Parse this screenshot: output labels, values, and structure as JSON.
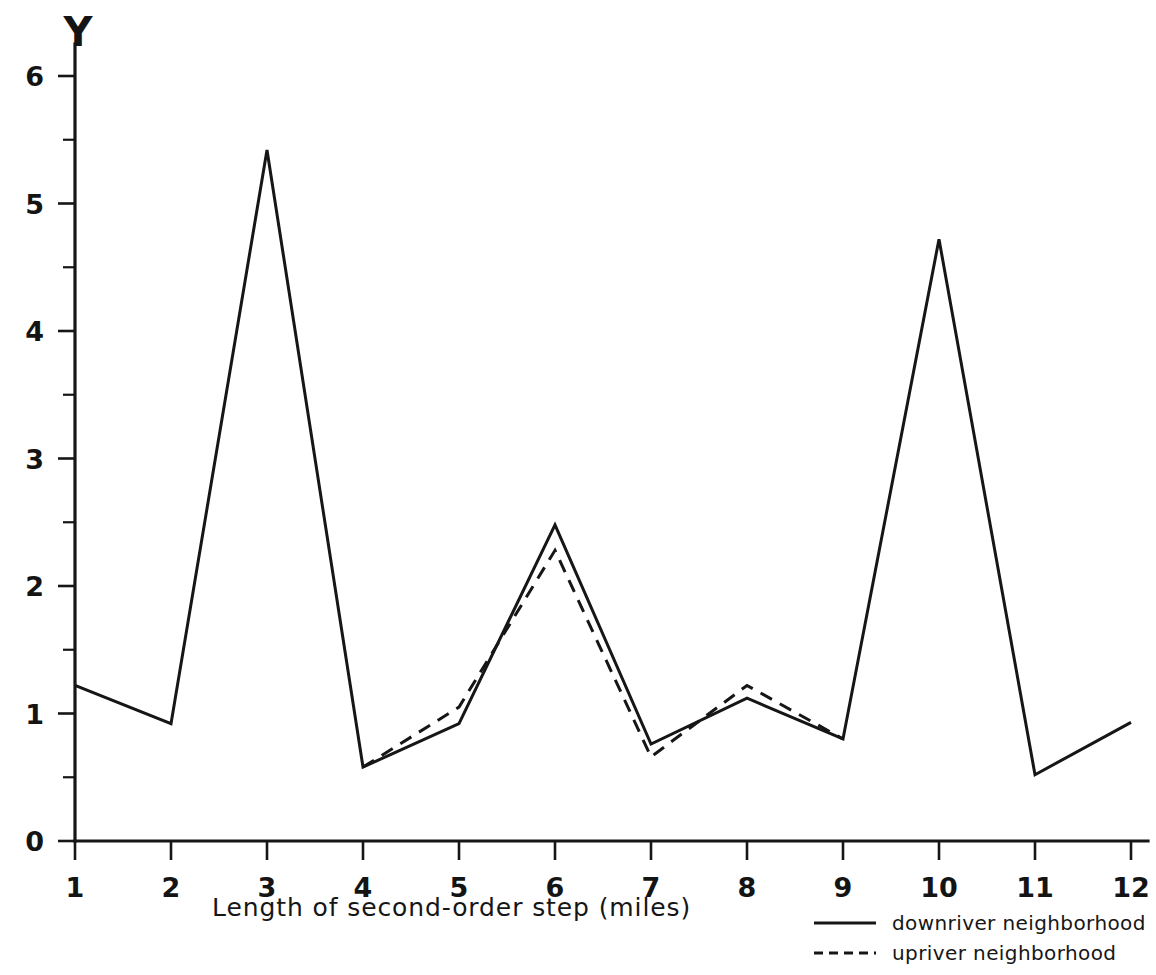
{
  "chart_data": {
    "type": "line",
    "title": "",
    "xlabel": "Length of second-order step (miles)",
    "ylabel": "Y",
    "x": [
      1,
      2,
      3,
      4,
      5,
      6,
      7,
      8,
      9,
      10,
      11,
      12
    ],
    "xticklabels": [
      "1",
      "2",
      "3",
      "4",
      "5",
      "6",
      "7",
      "8",
      "9",
      "10",
      "11",
      "12"
    ],
    "yticklabels": [
      "0",
      "1",
      "2",
      "3",
      "4",
      "5",
      "6"
    ],
    "ytickvalues": [
      0,
      1,
      2,
      3,
      4,
      5,
      6
    ],
    "yminorticks": [
      0.5,
      1.5,
      2.5,
      3.5,
      4.5,
      5.5
    ],
    "xlim": [
      0.7,
      12.35
    ],
    "ylim": [
      0,
      6.25
    ],
    "grid": false,
    "legend_position": "bottom-right",
    "series": [
      {
        "name": "downriver neighborhood",
        "style": "solid",
        "color": "#161616",
        "x": [
          1,
          2,
          3,
          4,
          5,
          6,
          7,
          8,
          9,
          10,
          11,
          12
        ],
        "values": [
          1.22,
          0.92,
          5.42,
          0.58,
          0.92,
          2.48,
          0.76,
          1.12,
          0.8,
          4.72,
          0.52,
          0.93
        ]
      },
      {
        "name": "upriver neighborhood",
        "style": "dashed",
        "color": "#161616",
        "x": [
          4,
          5,
          6,
          7,
          8,
          9
        ],
        "values": [
          0.58,
          1.05,
          2.28,
          0.66,
          1.22,
          0.8
        ]
      }
    ]
  },
  "axes": {
    "ylabel_letter": "Y",
    "xaxis_title": "Length of second-order step (miles)"
  },
  "legend": {
    "entries": [
      {
        "label": "downriver neighborhood",
        "style": "solid"
      },
      {
        "label": "upriver neighborhood",
        "style": "dashed"
      }
    ]
  }
}
